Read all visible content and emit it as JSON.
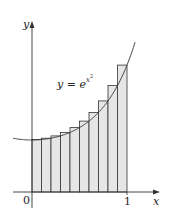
{
  "figure": {
    "type": "riemann_sum_diagram",
    "function_label": {
      "lhs": "y",
      "eq": " = ",
      "base": "e",
      "exp_var": "x",
      "exp_pow": "2"
    },
    "axes": {
      "x_label": "x",
      "y_label": "y",
      "origin_label": "0",
      "x_tick_label": "1"
    },
    "colors": {
      "rect_fill": "#e6e6e6",
      "stroke": "#333333",
      "background": "#ffffff"
    }
  },
  "chart_data": {
    "type": "riemann_sum",
    "function": "y = e^(x^2)",
    "interval": [
      0,
      1
    ],
    "n_subintervals": 10,
    "endpoint_rule": "right",
    "x": [
      0.1,
      0.2,
      0.3,
      0.4,
      0.5,
      0.6,
      0.7,
      0.8,
      0.9,
      1.0
    ],
    "heights": [
      1.01,
      1.041,
      1.094,
      1.174,
      1.284,
      1.433,
      1.632,
      1.896,
      2.248,
      2.718
    ],
    "xlabel": "x",
    "ylabel": "y",
    "x_ticks": [
      "0",
      "1"
    ],
    "annotations": [
      "y = e^{x^2}"
    ],
    "grid": false
  }
}
